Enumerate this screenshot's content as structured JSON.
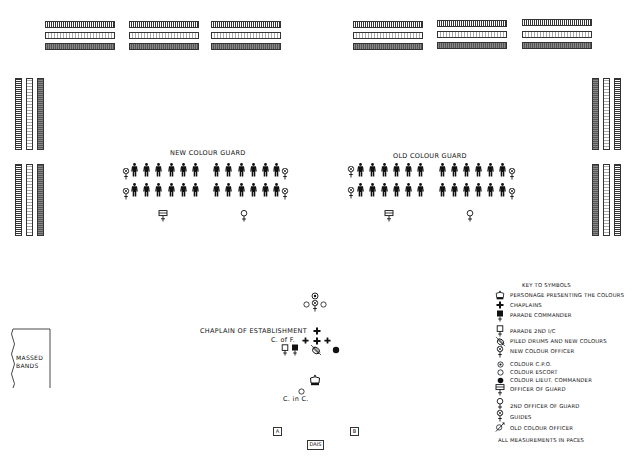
{
  "diagram": {
    "type": "parade-ground layout",
    "groups": {
      "new_colour_guard": {
        "label": "NEW COLOUR GUARD",
        "rows": 2,
        "left_file_count": 6,
        "right_file_count": 6
      },
      "old_colour_guard": {
        "label": "OLD COLOUR GUARD",
        "rows": 2,
        "left_file_count": 6,
        "right_file_count": 6
      }
    },
    "center_labels": {
      "chaplain_of_establishment": "CHAPLAIN OF ESTABLISHMENT",
      "c_of_f": "C. of F.",
      "c_in_c": "C. in C."
    },
    "massed_bands": "MASSED\nBANDS",
    "markers": {
      "a": "A",
      "b": "B",
      "dais": "DAIS"
    },
    "stands": {
      "top_left_count": 9,
      "top_right_count": 9,
      "left_count": 6,
      "right_count": 6
    }
  },
  "key": {
    "title": "KEY TO SYMBOLS",
    "items": [
      {
        "symbol": "crown-icon",
        "label": "PERSONAGE PRESENTING THE COLOURS"
      },
      {
        "symbol": "cross-icon",
        "label": "CHAPLAINS"
      },
      {
        "symbol": "filled-square-pin-icon",
        "label": "PARADE COMMANDER"
      },
      {
        "symbol": "open-square-pin-icon",
        "label": "PARADE 2ND I/C"
      },
      {
        "symbol": "piled-drums-icon",
        "label": "PILED DRUMS AND NEW COLOURS"
      },
      {
        "symbol": "new-colour-officer-icon",
        "label": "NEW COLOUR OFFICER"
      },
      {
        "symbol": "dotted-circle-icon",
        "label": "COLOUR C.P.O."
      },
      {
        "symbol": "open-circle-icon",
        "label": "COLOUR ESCORT"
      },
      {
        "symbol": "filled-circle-icon",
        "label": "COLOUR LIEUT. COMMANDER"
      },
      {
        "symbol": "officer-of-guard-icon",
        "label": "OFFICER OF GUARD"
      },
      {
        "symbol": "female-sign-icon",
        "label": "2ND OFFICER OF GUARD"
      },
      {
        "symbol": "guides-icon",
        "label": "GUIDES"
      },
      {
        "symbol": "old-colour-officer-icon",
        "label": "OLD COLOUR OFFICER"
      }
    ],
    "footer": "ALL MEASUREMENTS IN PACES"
  }
}
